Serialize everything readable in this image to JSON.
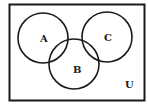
{
  "diagram": {
    "type": "venn",
    "universe_label": "U",
    "sets": [
      {
        "label": "A",
        "cx": 43,
        "cy": 38,
        "r": 25
      },
      {
        "label": "B",
        "cx": 74,
        "cy": 64,
        "r": 25
      },
      {
        "label": "C",
        "cx": 107,
        "cy": 37,
        "r": 25
      }
    ],
    "stroke_color": "#1a1a1a",
    "background": "#ffffff"
  }
}
